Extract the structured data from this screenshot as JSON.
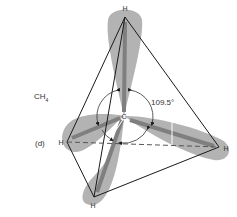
{
  "figure": {
    "molecule_label": "CH",
    "molecule_subscript": "4",
    "panel_label": "(d)",
    "angle_label": "109.5°",
    "center_atom": "C",
    "atoms": {
      "top": "H",
      "left": "H",
      "right": "H",
      "bottom": "H"
    }
  },
  "colors": {
    "lobe_fill": "#b3b3b3",
    "lobe_core": "#7f7f7f",
    "edge": "#1a1a1a",
    "text": "#333333"
  }
}
